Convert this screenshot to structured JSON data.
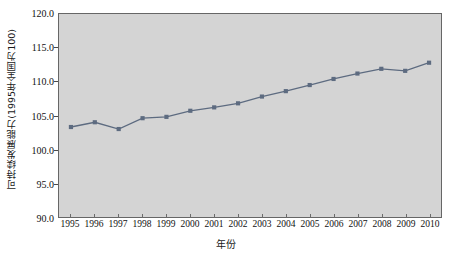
{
  "chart_data": {
    "type": "line",
    "title": "",
    "xlabel": "年份",
    "ylabel": "可持续发展能力(1995年全国为100)",
    "categories": [
      "1995",
      "1996",
      "1997",
      "1998",
      "1999",
      "2000",
      "2001",
      "2002",
      "2003",
      "2004",
      "2005",
      "2006",
      "2007",
      "2008",
      "2009",
      "2010"
    ],
    "values": [
      103.3,
      104.0,
      103.0,
      104.6,
      104.8,
      105.7,
      106.2,
      106.8,
      107.8,
      108.6,
      109.5,
      110.4,
      111.2,
      111.9,
      111.6,
      112.8
    ],
    "ylim": [
      90.0,
      120.0
    ],
    "ytick_labels": [
      "90.0",
      "95.0",
      "100.0",
      "105.0",
      "110.0",
      "115.0",
      "120.0"
    ],
    "ytick_values": [
      90.0,
      95.0,
      100.0,
      105.0,
      110.0,
      115.0,
      120.0
    ],
    "ytick_step": 5.0,
    "grid": false,
    "legend": "none",
    "series_color": "#5d6b80",
    "marker": "square",
    "plot_background": "#d4d4d4",
    "axis_color": "#666666"
  }
}
